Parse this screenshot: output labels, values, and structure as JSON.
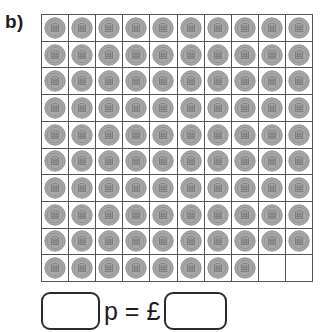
{
  "question": {
    "part_label": "b)",
    "topic": "count the pennies and write the total"
  },
  "coin_grid": {
    "columns": 10,
    "rows": 10,
    "total_cells": 100,
    "coin_count": 98,
    "empty_cell_count": 2,
    "coin_name": "one-penny-coin",
    "coin_value_pence": 1,
    "row_coin_counts": [
      10,
      10,
      10,
      10,
      10,
      10,
      10,
      10,
      10,
      8
    ],
    "colors": {
      "grid_line": "#555555",
      "coin_face": "#a8a8a8",
      "coin_rim": "#8c8c8c",
      "coin_detail": "#767676",
      "cell_background": "#ffffff"
    }
  },
  "answer": {
    "pence_box_value": "",
    "pence_box_placeholder": "",
    "operator_text": "p = £",
    "pounds_box_value": "",
    "pounds_box_placeholder": "",
    "pence_unit": "p",
    "pounds_symbol": "£",
    "equals_symbol": "="
  },
  "chart_data": {
    "type": "table",
    "categories": [
      "Row 1",
      "Row 2",
      "Row 3",
      "Row 4",
      "Row 5",
      "Row 6",
      "Row 7",
      "Row 8",
      "Row 9",
      "Row 10"
    ],
    "values": [
      10,
      10,
      10,
      10,
      10,
      10,
      10,
      10,
      10,
      8
    ],
    "xlabel": "Row",
    "ylabel": "Number of pennies",
    "ylim": [
      0,
      10
    ],
    "total": 98,
    "grid": true,
    "legend": false
  }
}
